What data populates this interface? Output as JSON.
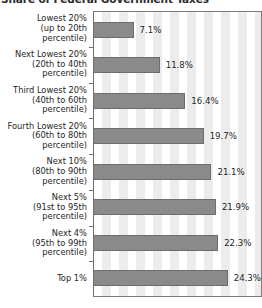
{
  "chart_data": {
    "type": "bar",
    "orientation": "horizontal",
    "title": "Share of Federal Government Taxes",
    "xlabel": "",
    "ylabel": "",
    "xlim": [
      0,
      30
    ],
    "grid": true,
    "grid_style": "vertical-stripes",
    "legend": null,
    "bar_color": "#8a8a8a",
    "categories": [
      "Lowest 20% (up to 20th percentile)",
      "Next Lowest 20% (20th to 40th percentile)",
      "Third Lowest 20% (40th to 60th percentile)",
      "Fourth Lowest 20% (60th to 80th percentile)",
      "Next 10% (80th to 90th percentile)",
      "Next 5% (91st to 95th percentile)",
      "Next 4% (95th to 99th percentile)",
      "Top 1%"
    ],
    "values": [
      7.1,
      11.8,
      16.4,
      19.7,
      21.1,
      21.9,
      22.3,
      24.3
    ],
    "value_labels": [
      "7.1%",
      "11.8%",
      "16.4%",
      "19.7%",
      "21.1%",
      "21.9%",
      "22.3%",
      "24.3%"
    ]
  },
  "rows": [
    {
      "lines": [
        "Lowest 20%",
        "(up to 20th",
        "percentile)"
      ],
      "value": 7.1,
      "value_label": "7.1%"
    },
    {
      "lines": [
        "Next Lowest 20%",
        "(20th to 40th",
        "percentile)"
      ],
      "value": 11.8,
      "value_label": "11.8%"
    },
    {
      "lines": [
        "Third Lowest 20%",
        "(40th to 60th",
        "percentile)"
      ],
      "value": 16.4,
      "value_label": "16.4%"
    },
    {
      "lines": [
        "Fourth Lowest 20%",
        "(60th to 80th",
        "percentile)"
      ],
      "value": 19.7,
      "value_label": "19.7%"
    },
    {
      "lines": [
        "Next 10%",
        "(80th to 90th",
        "percentile)"
      ],
      "value": 21.1,
      "value_label": "21.1%"
    },
    {
      "lines": [
        "Next 5%",
        "(91st to 95th",
        "percentile)"
      ],
      "value": 21.9,
      "value_label": "21.9%"
    },
    {
      "lines": [
        "Next 4%",
        "(95th to 99th",
        "percentile)"
      ],
      "value": 22.3,
      "value_label": "22.3%"
    },
    {
      "lines": [
        "Top 1%"
      ],
      "value": 24.3,
      "value_label": "24.3%"
    }
  ]
}
